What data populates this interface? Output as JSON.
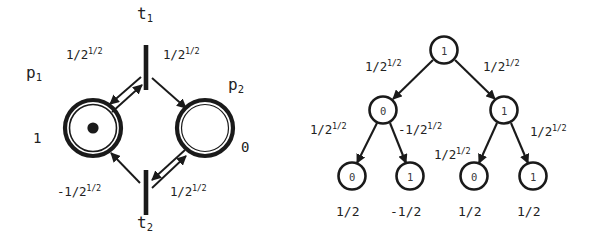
{
  "figure": {
    "background": "#ffffff",
    "ink": "#1a1a1a"
  },
  "petri_net": {
    "name": "petri-net",
    "places": [
      {
        "id": "p1",
        "label": "p",
        "label_sub": "1",
        "marking": "1",
        "tokens": 1,
        "cx": 93,
        "cy": 128,
        "r": 28
      },
      {
        "id": "p2",
        "label": "p",
        "label_sub": "2",
        "marking": "0",
        "tokens": 0,
        "cx": 205,
        "cy": 128,
        "r": 28
      }
    ],
    "transitions": [
      {
        "id": "t1",
        "label": "t",
        "label_sub": "1",
        "x": 146,
        "y": 45,
        "height": 45
      },
      {
        "id": "t2",
        "label": "t",
        "label_sub": "2",
        "x": 146,
        "y": 170,
        "height": 45
      }
    ],
    "arc_weights": {
      "t1_to_p1": {
        "base": "1/2",
        "exp": "1/2"
      },
      "t1_to_p2": {
        "base": "1/2",
        "exp": "1/2"
      },
      "t2_to_p1": {
        "base": "-1/2",
        "exp": "1/2"
      },
      "t2_to_p2": {
        "base": "1/2",
        "exp": "1/2"
      }
    }
  },
  "tree": {
    "name": "decision-tree",
    "nodes": {
      "root": {
        "value": "1",
        "cx": 444,
        "cy": 50,
        "r": 14
      },
      "l": {
        "value": "0",
        "cx": 383,
        "cy": 110,
        "r": 14
      },
      "r": {
        "value": "1",
        "cx": 504,
        "cy": 110,
        "r": 14
      },
      "ll": {
        "value": "0",
        "cx": 352,
        "cy": 176,
        "r": 14
      },
      "lr": {
        "value": "1",
        "cx": 410,
        "cy": 176,
        "r": 14
      },
      "rl": {
        "value": "0",
        "cx": 474,
        "cy": 176,
        "r": 14
      },
      "rr": {
        "value": "1",
        "cx": 533,
        "cy": 176,
        "r": 14
      }
    },
    "edge_weights": {
      "root_l": {
        "base": "1/2",
        "exp": "1/2"
      },
      "root_r": {
        "base": "1/2",
        "exp": "1/2"
      },
      "l_ll": {
        "base": "1/2",
        "exp": "1/2"
      },
      "l_lr": {
        "base": "-1/2",
        "exp": "1/2"
      },
      "r_rl": {
        "base": "1/2",
        "exp": "1/2"
      },
      "r_rr": {
        "base": "1/2",
        "exp": "1/2"
      }
    },
    "leaf_values": [
      "1/2",
      "-1/2",
      "1/2",
      "1/2"
    ]
  }
}
